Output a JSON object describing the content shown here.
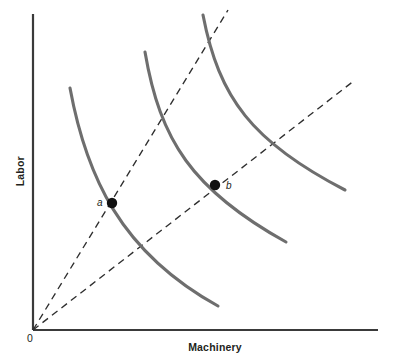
{
  "figure": {
    "background_color": "#ffffff",
    "width": 401,
    "height": 360
  },
  "axes": {
    "x_label": "Machinery",
    "y_label": "Labor",
    "origin_label": "0",
    "axis_color": "#3a3a3a",
    "x_axis": {
      "x1": 33,
      "y1": 330,
      "x2": 378,
      "y2": 330
    },
    "y_axis": {
      "x1": 33,
      "y1": 14,
      "x2": 33,
      "y2": 330
    }
  },
  "point_labels": {
    "a": "a",
    "b": "b"
  },
  "chart_data": {
    "type": "line",
    "title": "",
    "subtitle": "",
    "xlabel": "Machinery",
    "ylabel": "Labor",
    "xlim": [
      0,
      1
    ],
    "ylim": [
      0,
      1
    ],
    "grid": false,
    "legend": "none",
    "annotations": [
      {
        "name": "a",
        "text": "a",
        "x": 112,
        "y": 203,
        "marker": "filled-circle",
        "marker_radius": 5.2,
        "label_position": "left"
      },
      {
        "name": "b",
        "text": "b",
        "x": 215,
        "y": 185,
        "marker": "filled-circle",
        "marker_radius": 5.2,
        "label_position": "right"
      }
    ],
    "series": [
      {
        "name": "isoquant-1",
        "kind": "isoquant",
        "style": "solid",
        "color": "#6e6e6e",
        "width": 3.1,
        "path": "M 70 88 C 86 175, 120 252, 218 306"
      },
      {
        "name": "isoquant-2",
        "kind": "isoquant",
        "style": "solid",
        "color": "#6e6e6e",
        "width": 3.1,
        "path": "M 145 52 C 160 140, 192 190, 286 242"
      },
      {
        "name": "isoquant-3",
        "kind": "isoquant",
        "style": "solid",
        "color": "#6e6e6e",
        "width": 3.1,
        "path": "M 203 15 C 219 98, 252 142, 345 190"
      },
      {
        "name": "expansion-ray-steep",
        "kind": "ray",
        "style": "dashed",
        "color": "#2e2e2e",
        "width": 1.35,
        "dash": "7 5",
        "path": "M 33 330 L 228 10",
        "from": [
          33,
          330
        ],
        "to": [
          228,
          10
        ]
      },
      {
        "name": "expansion-ray-shallow",
        "kind": "ray",
        "style": "dashed",
        "color": "#2e2e2e",
        "width": 1.35,
        "dash": "7 5",
        "path": "M 33 330 L 355 80",
        "from": [
          33,
          330
        ],
        "to": [
          355,
          80
        ]
      }
    ]
  }
}
